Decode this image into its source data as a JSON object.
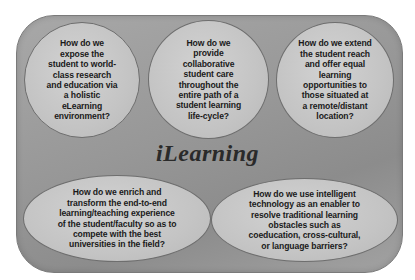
{
  "diagram": {
    "title": "iLearning",
    "colors": {
      "outer_box": "#999999",
      "bubble_fill": "#c8c8c8",
      "bubble_border": "#6e6e6e",
      "text": "#1a1a1a"
    },
    "questions": [
      {
        "shape": "circle",
        "position": "top-left",
        "text": "How do we\nexpose the\nstudent to world-\nclass research\nand education via\na holistic\neLearning\nenvironment?"
      },
      {
        "shape": "circle",
        "position": "top-center",
        "text": "How do we\nprovide\ncollaborative\nstudent care\nthroughout the\nentire path of a\nstudent learning\nlife-cycle?"
      },
      {
        "shape": "circle",
        "position": "top-right",
        "text": "How do we extend\nthe student reach\nand offer equal\nlearning\nopportunities to\nthose situated at\na remote/distant\nlocation?"
      },
      {
        "shape": "ellipse",
        "position": "bottom-left",
        "text": "How do we enrich and\ntransform the end-to-end\nlearning/teaching experience\nof the student/faculty so as to\ncompete with the best\nuniversities in the field?"
      },
      {
        "shape": "ellipse",
        "position": "bottom-right",
        "text": "How do we use intelligent\ntechnology as an enabler to\nresolve traditional learning\nobstacles such as\ncoeducation, cross-cultural,\nor language barriers?"
      }
    ]
  }
}
